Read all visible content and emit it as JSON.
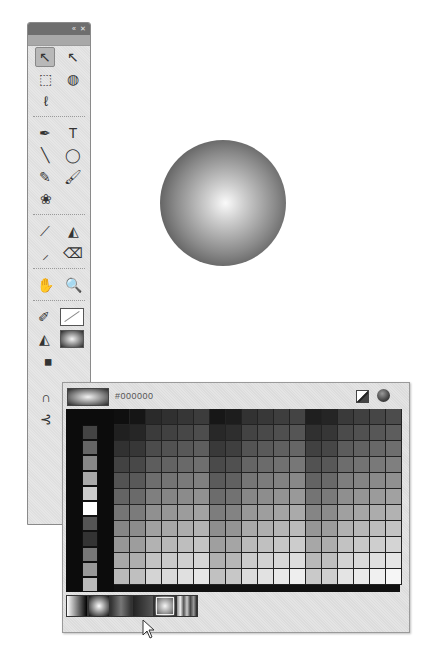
{
  "tools_panel": {
    "title_buttons": [
      "«",
      "✕"
    ],
    "rows": [
      [
        {
          "name": "selection-tool",
          "glyph": "↖",
          "selected": true
        },
        {
          "name": "subselection-tool",
          "glyph": "↖",
          "selected": false
        }
      ],
      [
        {
          "name": "free-transform-tool",
          "glyph": "⬚",
          "selected": false
        },
        {
          "name": "3d-rotation-tool",
          "glyph": "◍",
          "selected": false
        }
      ],
      [
        {
          "name": "lasso-tool",
          "glyph": "ℓ",
          "selected": false
        }
      ],
      "sep",
      [
        {
          "name": "pen-tool",
          "glyph": "✒",
          "selected": false
        },
        {
          "name": "text-tool",
          "glyph": "T",
          "selected": false
        }
      ],
      [
        {
          "name": "line-tool",
          "glyph": "╲",
          "selected": false
        },
        {
          "name": "oval-tool",
          "glyph": "◯",
          "selected": false
        }
      ],
      [
        {
          "name": "pencil-tool",
          "glyph": "✎",
          "selected": false
        },
        {
          "name": "brush-tool",
          "glyph": "🖌",
          "selected": false
        }
      ],
      [
        {
          "name": "deco-tool",
          "glyph": "❀",
          "selected": false
        }
      ],
      "sep",
      [
        {
          "name": "bone-tool",
          "glyph": "⟋",
          "selected": false
        },
        {
          "name": "paint-bucket-tool",
          "glyph": "◭",
          "selected": false
        }
      ],
      [
        {
          "name": "eyedropper-tool",
          "glyph": "⸝",
          "selected": false
        },
        {
          "name": "eraser-tool",
          "glyph": "⌫",
          "selected": false
        }
      ],
      "sep",
      [
        {
          "name": "hand-tool",
          "glyph": "✋",
          "selected": false
        },
        {
          "name": "zoom-tool",
          "glyph": "🔍",
          "selected": false
        }
      ]
    ],
    "stroke_icon": "✐",
    "fill_icon": "◭",
    "swap_icon": "◼",
    "bottom_icons": [
      {
        "name": "snap-to-objects-icon",
        "glyph": "∩"
      },
      {
        "name": "smooth-icon",
        "glyph": "⊰"
      }
    ]
  },
  "canvas": {
    "shape": "radial-gradient-circle"
  },
  "swatch_panel": {
    "hex_value": "#000000",
    "no_color_label": "no-color",
    "color_picker_label": "color-picker",
    "gray_column": [
      "#444444",
      "#666666",
      "#888888",
      "#aaaaaa",
      "#cccccc",
      "#ffffff",
      "#555555",
      "#333333",
      "#777777",
      "#999999",
      "#bbbbbb"
    ],
    "grid_rows": 11,
    "grid_cols": 18,
    "gradients": [
      {
        "name": "linear-white-black",
        "css": "linear-gradient(90deg,#fff,#000)"
      },
      {
        "name": "radial-white-black",
        "css": "radial-gradient(circle,#fff 0%,#888 50%,#111 100%)"
      },
      {
        "name": "linear-dark",
        "css": "linear-gradient(90deg,#333,#777,#333)"
      },
      {
        "name": "linear-dark-2",
        "css": "linear-gradient(90deg,#222,#555)"
      },
      {
        "name": "radial-selected",
        "css": "radial-gradient(circle,#f5f5f5 0%,#999 50%,#333 100%)"
      },
      {
        "name": "linear-rainbow",
        "css": "linear-gradient(90deg,#888,#eee,#555,#ccc,#444,#999,#222)"
      }
    ],
    "selected_gradient_index": 4
  }
}
